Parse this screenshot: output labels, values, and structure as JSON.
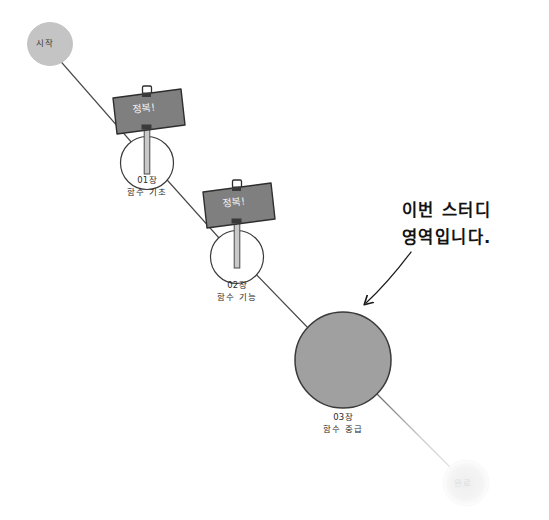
{
  "diagram": {
    "colors": {
      "background": "#ffffff",
      "path_line": "#4a4a4a",
      "path_line_faded": "#d8d8d8",
      "sign_fill": "#7f7f7f",
      "sign_stroke": "#2e2e2e",
      "sign_text": "#f2f2f2",
      "node_outline": "#3a3a3a",
      "node_fill_empty": "#ffffff",
      "node_fill_active": "#a0a0a0",
      "start_fill": "#c4c4c4",
      "end_fill": "#f2f2f2",
      "end_text": "#dedede",
      "annotation": "#131313",
      "label_text": "#2b2b2b"
    },
    "start_node": {
      "name": "start-node",
      "text": "시작"
    },
    "end_node": {
      "name": "end-node",
      "text": "완료"
    },
    "annotation": {
      "name": "study-area-annotation",
      "line1": "이번 스터디",
      "line2": "영역입니다.",
      "arrow": "curved-arrow-icon"
    },
    "nodes": [
      {
        "id": "chapter-01",
        "chapter": "01장",
        "title": "함수 기초",
        "sign_label": "정복!",
        "has_sign": true,
        "state": "completed"
      },
      {
        "id": "chapter-02",
        "chapter": "02장",
        "title": "함수 기능",
        "sign_label": "정복!",
        "has_sign": true,
        "state": "completed"
      },
      {
        "id": "chapter-03",
        "chapter": "03장",
        "title": "함수 중급",
        "sign_label": "",
        "has_sign": false,
        "state": "current"
      }
    ]
  }
}
